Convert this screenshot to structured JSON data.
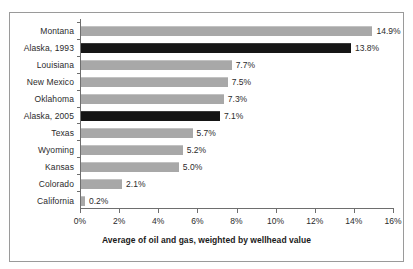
{
  "chart_data": {
    "type": "bar",
    "orientation": "horizontal",
    "title": "",
    "xlabel": "Average of oil and gas, weighted by wellhead value",
    "ylabel": "",
    "xlim": [
      0,
      16
    ],
    "xtick_labels": [
      "0%",
      "2%",
      "4%",
      "6%",
      "8%",
      "10%",
      "12%",
      "14%",
      "16%"
    ],
    "xtick_values": [
      0,
      2,
      4,
      6,
      8,
      10,
      12,
      14,
      16
    ],
    "grid": false,
    "legend": "none",
    "categories": [
      "Montana",
      "Alaska, 1993",
      "Louisiana",
      "New Mexico",
      "Oklahoma",
      "Alaska, 2005",
      "Texas",
      "Wyoming",
      "Kansas",
      "Colorado",
      "California"
    ],
    "values": [
      14.9,
      13.8,
      7.7,
      7.5,
      7.3,
      7.1,
      5.7,
      5.2,
      5.0,
      2.1,
      0.2
    ],
    "value_labels": [
      "14.9%",
      "13.8%",
      "7.7%",
      "7.5%",
      "7.3%",
      "7.1%",
      "5.7%",
      "5.2%",
      "5.0%",
      "2.1%",
      "0.2%"
    ],
    "highlighted": [
      false,
      true,
      false,
      false,
      false,
      true,
      false,
      false,
      false,
      false,
      false
    ],
    "colors": {
      "bar": "#a8a8a8",
      "bar_highlight": "#151515",
      "axis": "#6e6e6e",
      "text": "#2b2b2b",
      "frame": "#9a9a9a",
      "background": "#ffffff"
    }
  }
}
